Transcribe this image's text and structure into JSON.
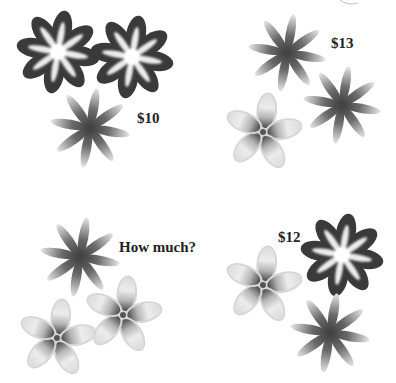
{
  "puzzle": {
    "groups": [
      {
        "id": "group-1",
        "price_label": "$10",
        "label_pos": [
          137,
          111
        ],
        "flowers": [
          {
            "type": "dark",
            "cx": 58,
            "cy": 52,
            "r": 41
          },
          {
            "type": "dark",
            "cx": 132,
            "cy": 57,
            "r": 41
          },
          {
            "type": "star",
            "cx": 90,
            "cy": 128,
            "r": 40
          }
        ]
      },
      {
        "id": "group-2",
        "price_label": "$13",
        "label_pos": [
          331,
          36
        ],
        "flowers": [
          {
            "type": "star",
            "cx": 287,
            "cy": 53,
            "r": 39
          },
          {
            "type": "star",
            "cx": 342,
            "cy": 105,
            "r": 39
          },
          {
            "type": "plumeria",
            "cx": 263,
            "cy": 132,
            "r": 38
          }
        ]
      },
      {
        "id": "group-3",
        "price_label": "How much?",
        "label_pos": [
          119,
          240
        ],
        "flowers": [
          {
            "type": "star",
            "cx": 80,
            "cy": 257,
            "r": 40
          },
          {
            "type": "plumeria",
            "cx": 57,
            "cy": 338,
            "r": 38
          },
          {
            "type": "plumeria",
            "cx": 123,
            "cy": 315,
            "r": 38
          }
        ]
      },
      {
        "id": "group-4",
        "price_label": "$12",
        "label_pos": [
          278,
          230
        ],
        "flowers": [
          {
            "type": "dark",
            "cx": 342,
            "cy": 255,
            "r": 41
          },
          {
            "type": "plumeria",
            "cx": 263,
            "cy": 285,
            "r": 38
          },
          {
            "type": "star",
            "cx": 330,
            "cy": 333,
            "r": 40
          }
        ]
      }
    ],
    "colors": {
      "dark_petal": "#3a3a3a",
      "star_petal": "#555555",
      "plumeria_petal": "#e4e4e4",
      "plumeria_center": "#4a4a4a",
      "text": "#222222",
      "background": "#ffffff"
    }
  }
}
